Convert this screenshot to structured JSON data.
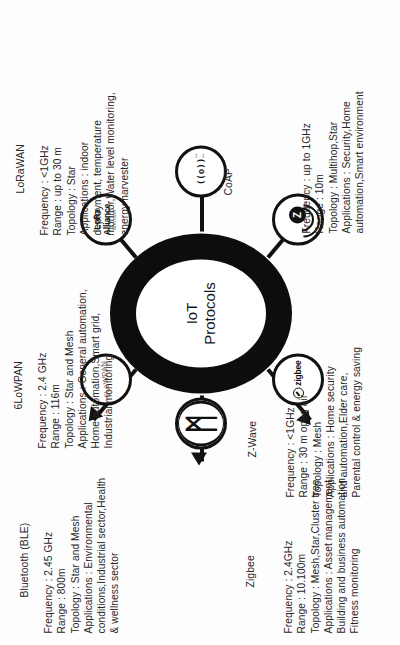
{
  "diagram": {
    "center": {
      "line1": "IoT",
      "line2": "Protocols"
    },
    "nodes": [
      {
        "id": "bluetooth",
        "title": "Bluetooth (BLE)",
        "icon": "bluetooth-icon",
        "icon_text": "ᛗ",
        "lines": [
          "Frequency : 2.45 GHz",
          "Range : 800m",
          "Topology : Star and Mesh",
          "Applications : Environmental",
          "conditions,Industrial sector,Health",
          "& wellness sector"
        ]
      },
      {
        "id": "6lowpan",
        "title": "6LoWPAN",
        "icon": "6lowpan-logo-icon",
        "icon_text": "6LoWPAN",
        "lines": [
          "Frequency : 2.4 GHz",
          "Range : 116m",
          "Topology : Star and Mesh",
          "Applications : General automation,",
          "Home automation,Smart grid,",
          "Industrial monitoring"
        ]
      },
      {
        "id": "lorawan",
        "title": "LoRaWAN",
        "icon": "lora-alliance-logo-icon",
        "icon_top": "LoRa",
        "icon_mid": "Alliance",
        "icon_sub": "Member",
        "lines": [
          "Frequency : <1GHz",
          "Range : up to 30 m",
          "Topology : Star",
          "Applications : indoor",
          "deployment, temperature",
          "monitor,Water level monitoring,",
          "energy harvester"
        ]
      },
      {
        "id": "coap",
        "title": "CoAP",
        "icon": "rf-signal-icon",
        "icon_text": "↯",
        "lines": [
          "Frequency : up to 1GHz",
          "Range : 10m",
          "Topology : Multihop,Star",
          "Applications : Security,Home",
          "automation,Smart environment"
        ]
      },
      {
        "id": "zwave",
        "title": "Z-Wave",
        "icon": "zwave-antenna-icon",
        "icon_text": "Z-Wave",
        "lines": [
          "Frequency : <1GHz",
          "Range : 30 m open air",
          "Topology : Mesh",
          "Applications : Home security",
          "and automation,Elder care,",
          "Parental control & energy saving"
        ]
      },
      {
        "id": "zigbee",
        "title": "Zigbee",
        "icon": "zigbee-logo-icon",
        "icon_text": "zigbee",
        "lines": [
          "Frequency : 2.4GHz",
          "Range : 10.100m",
          "Topology : Mesh,Star,Cluster tree",
          "Applications : Asset management,",
          "Building and business automation,",
          "Fitness monitoring"
        ]
      }
    ],
    "colors": {
      "ink": "#111111",
      "text": "#2a2627",
      "faint": "#8d8d8d",
      "background": "#ffffff"
    }
  }
}
